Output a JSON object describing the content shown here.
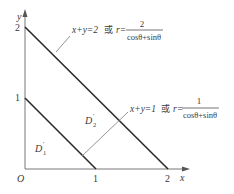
{
  "diagram": {
    "axes": {
      "x_label": "x",
      "y_label": "y",
      "origin_label": "O",
      "x_ticks": [
        "1",
        "2"
      ],
      "y_ticks": [
        "1",
        "2"
      ]
    },
    "lines": [
      {
        "name": "outer-line",
        "equation": "x+y=2",
        "connector": "或",
        "polar_lhs": "r=",
        "polar_numerator": "2",
        "polar_denominator": "cosθ+sinθ"
      },
      {
        "name": "inner-line",
        "equation": "x+y=1",
        "connector": "或",
        "polar_lhs": "r=",
        "polar_numerator": "1",
        "polar_denominator": "cosθ+sinθ"
      }
    ],
    "regions": [
      {
        "name": "D1",
        "base": "D",
        "sub": "1",
        "sup": "′"
      },
      {
        "name": "D2",
        "base": "D",
        "sub": "2",
        "sup": "′"
      }
    ],
    "colors": {
      "stroke": "#2a2a2a",
      "leader": "#888888",
      "text": "#3a3a3a"
    }
  }
}
